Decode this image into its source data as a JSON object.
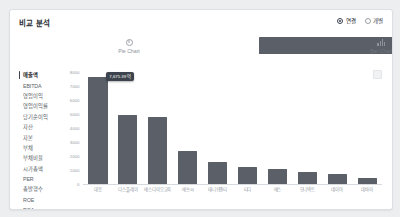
{
  "card": {
    "title": "비교 분석"
  },
  "mode_options": [
    {
      "label": "연결",
      "selected": true
    },
    {
      "label": "개별",
      "selected": false
    }
  ],
  "chart_types": [
    {
      "label": "Pie Chart",
      "icon": "pie-chart-icon",
      "active": false
    },
    {
      "label": "Bar Chart",
      "icon": "bar-chart-icon",
      "active": true
    }
  ],
  "metrics": [
    {
      "label": "매출액",
      "active": true
    },
    {
      "label": "EBITDA",
      "active": false
    },
    {
      "label": "영업이익",
      "active": false
    },
    {
      "label": "영업이익률",
      "active": false
    },
    {
      "label": "당기순이익",
      "active": false
    },
    {
      "label": "자산",
      "active": false
    },
    {
      "label": "자본",
      "active": false
    },
    {
      "label": "부채",
      "active": false
    },
    {
      "label": "부채비율",
      "active": false
    },
    {
      "label": "시가총액",
      "active": false
    },
    {
      "label": "PER",
      "active": false
    },
    {
      "label": "총발행수",
      "active": false
    },
    {
      "label": "ROE",
      "active": false
    },
    {
      "label": "ROA",
      "active": false
    }
  ],
  "tooltip": {
    "text": "7,675.39 억"
  },
  "chart_data": {
    "type": "bar",
    "title": "매출액",
    "xlabel": "",
    "ylabel": "",
    "ylim": [
      0,
      8000
    ],
    "grid": false,
    "legend": "none",
    "yticks": [
      "8000",
      "7000",
      "6000",
      "5000",
      "4000",
      "3000",
      "2000",
      "1000",
      "0"
    ],
    "categories": [
      "대응",
      "디스플레이",
      "에스디이오교육",
      "에쓰씨",
      "태니쉬엔티",
      "티디",
      "에스",
      "모니텍트",
      "네이아",
      "대바이"
    ],
    "values": [
      7675,
      4900,
      4820,
      2350,
      1600,
      1250,
      1050,
      880,
      690,
      450
    ],
    "bar_color": "#5b6068"
  }
}
